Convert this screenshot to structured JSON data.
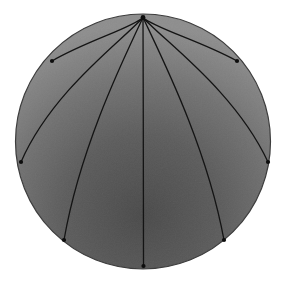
{
  "figure": {
    "background_color": "#ffffff",
    "canvas": {
      "width": 285,
      "height": 286
    }
  },
  "chart_data": {
    "type": "scatter",
    "title": "",
    "subtitle": "",
    "xlabel": "",
    "ylabel": "",
    "grid": false,
    "legend": null,
    "xlim": [
      0,
      285
    ],
    "ylim": [
      0,
      286
    ],
    "disk": {
      "center_x": 143,
      "center_y": 141.5,
      "radius": 127.5,
      "outline_color": "#3d3d3d",
      "outline_width": 1.2,
      "fill_light": "#8e8e8e",
      "fill_mid": "#6e6e6e",
      "fill_dark": "#4b4b4b",
      "shading_center_x": 143,
      "shading_center_y": 215,
      "shading_radius": 190
    },
    "apex": {
      "x": 143,
      "y": 17.5,
      "label": "apex"
    },
    "curve_color": "#141414",
    "curve_width": 1.3,
    "marker_color": "#0d0d0d",
    "marker_radius": 2.1,
    "curves": [
      {
        "name": "geodesic-left-outer",
        "endpoint": {
          "x": 52,
          "y": 61
        },
        "control1": {
          "x": 132,
          "y": 28
        },
        "control2": {
          "x": 86,
          "y": 41
        }
      },
      {
        "name": "geodesic-left-mid",
        "endpoint": {
          "x": 21,
          "y": 162
        },
        "control1": {
          "x": 122,
          "y": 41
        },
        "control2": {
          "x": 52,
          "y": 91
        }
      },
      {
        "name": "geodesic-left-inner",
        "endpoint": {
          "x": 64,
          "y": 240
        },
        "control1": {
          "x": 122,
          "y": 62
        },
        "control2": {
          "x": 80,
          "y": 148
        }
      },
      {
        "name": "geodesic-center",
        "endpoint": {
          "x": 143.5,
          "y": 266
        },
        "control1": {
          "x": 143.3,
          "y": 100
        },
        "control2": {
          "x": 143.4,
          "y": 190
        }
      },
      {
        "name": "geodesic-right-inner",
        "endpoint": {
          "x": 224,
          "y": 240
        },
        "control1": {
          "x": 164,
          "y": 62
        },
        "control2": {
          "x": 207,
          "y": 148
        }
      },
      {
        "name": "geodesic-right-mid",
        "endpoint": {
          "x": 268,
          "y": 162
        },
        "control1": {
          "x": 164,
          "y": 41
        },
        "control2": {
          "x": 235,
          "y": 91
        }
      },
      {
        "name": "geodesic-right-outer",
        "endpoint": {
          "x": 237,
          "y": 61
        },
        "control1": {
          "x": 154,
          "y": 28
        },
        "control2": {
          "x": 201,
          "y": 41
        }
      }
    ],
    "annotations": []
  }
}
